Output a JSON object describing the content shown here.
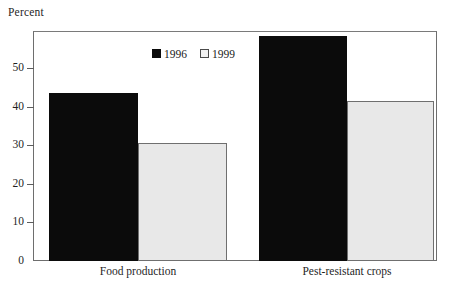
{
  "chart_data": {
    "type": "bar",
    "title": "",
    "xlabel": "",
    "ylabel": "Percent",
    "categories": [
      "Food production",
      "Pest-resistant crops"
    ],
    "series": [
      {
        "name": "1996",
        "color": "#0b0b0b",
        "values": [
          44,
          59
        ]
      },
      {
        "name": "1999",
        "color": "#e8e8e8",
        "values": [
          31,
          42
        ]
      }
    ],
    "ylim": [
      0,
      60
    ],
    "yticks": [
      0,
      10,
      20,
      30,
      40,
      50
    ],
    "ytick_labels": [
      "0",
      "10",
      "20",
      "30",
      "40",
      "50"
    ],
    "grid": false,
    "legend_position": "top-center"
  },
  "axis": {
    "y_title": "Percent",
    "ticks": [
      {
        "label": "50",
        "value": 50
      },
      {
        "label": "40",
        "value": 40
      },
      {
        "label": "30",
        "value": 30
      },
      {
        "label": "20",
        "value": 20
      },
      {
        "label": "10",
        "value": 10
      },
      {
        "label": "0",
        "value": 0
      }
    ]
  },
  "legend": {
    "entries": [
      {
        "label": "1996",
        "swatch": "dark"
      },
      {
        "label": "1999",
        "swatch": "light"
      }
    ]
  },
  "categories": [
    {
      "label": "Food production"
    },
    {
      "label": "Pest-resistant crops"
    }
  ],
  "bars": [
    {
      "name": "food-production-1996",
      "value": 44,
      "style": "dark"
    },
    {
      "name": "food-production-1999",
      "value": 31,
      "style": "light"
    },
    {
      "name": "pest-resistant-crops-1996",
      "value": 59,
      "style": "dark"
    },
    {
      "name": "pest-resistant-crops-1999",
      "value": 42,
      "style": "light"
    }
  ]
}
